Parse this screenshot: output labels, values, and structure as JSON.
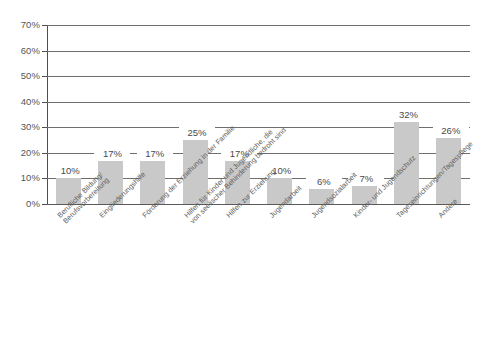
{
  "chart_data": {
    "type": "bar",
    "title": "",
    "subtitle": "",
    "xlabel": "",
    "ylabel": "",
    "ylim": [
      0,
      70
    ],
    "grid": true,
    "legend": "none",
    "orientation": "vertical",
    "bar_color": "#c9c9c9",
    "axis_color": "#6e6e6e",
    "value_suffix": "%",
    "y_ticks": [
      "0%",
      "10%",
      "20%",
      "30%",
      "40%",
      "50%",
      "60%",
      "70%"
    ],
    "y_tick_values": [
      0,
      10,
      20,
      30,
      40,
      50,
      60,
      70
    ],
    "categories": [
      "Berufliche Bildung/\nBerufsvorbereitung",
      "Eingliederungshilfe",
      "Förderung der Erziehung in der Familie",
      "Hilfen für Kinder und Jugendliche, die\nvon seelischer Behinderung bedroht sind",
      "Hilfen zur Erziehung",
      "Jugendarbeit",
      "Jugendsozialarbeit",
      "Kinder- und Jugendschutz",
      "Tageseinrichtungen/Tagespflege",
      "Andere"
    ],
    "category_lines": [
      [
        "Berufliche Bildung/",
        "Berufsvorbereitung"
      ],
      [
        "Eingliederungshilfe",
        ""
      ],
      [
        "Förderung der Erziehung in der Familie",
        ""
      ],
      [
        "Hilfen für Kinder und Jugendliche, die",
        "von seelischer Behinderung bedroht sind"
      ],
      [
        "Hilfen zur Erziehung",
        ""
      ],
      [
        "Jugendarbeit",
        ""
      ],
      [
        "Jugendsozialarbeit",
        ""
      ],
      [
        "Kinder- und Jugendschutz",
        ""
      ],
      [
        "Tageseinrichtungen/Tagespflege",
        ""
      ],
      [
        "Andere",
        ""
      ]
    ],
    "values": [
      10,
      17,
      17,
      25,
      17,
      10,
      6,
      7,
      32,
      26
    ],
    "value_labels": [
      "10%",
      "17%",
      "17%",
      "25%",
      "17%",
      "10%",
      "6%",
      "7%",
      "32%",
      "26%"
    ]
  }
}
